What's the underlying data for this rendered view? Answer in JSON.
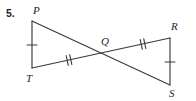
{
  "figure": {
    "problem_number": "5.",
    "stroke_color": "#3a3a3a",
    "label_color": "#1f1f1f",
    "background_color": "#ffffff",
    "vertices": [
      {
        "id": "P",
        "label": "P",
        "x": 32,
        "y": 21,
        "label_x": 33,
        "label_y": 5
      },
      {
        "id": "T",
        "label": "T",
        "x": 32,
        "y": 68,
        "label_x": 26,
        "label_y": 73
      },
      {
        "id": "Q",
        "label": "Q",
        "x": 106,
        "y": 53,
        "label_x": 101,
        "label_y": 36
      },
      {
        "id": "R",
        "label": "R",
        "x": 170,
        "y": 38,
        "label_x": 171,
        "label_y": 21
      },
      {
        "id": "S",
        "label": "S",
        "x": 170,
        "y": 85,
        "label_x": 169,
        "label_y": 88
      }
    ],
    "segments": [
      {
        "name": "PT",
        "from": "P",
        "to": "T",
        "x1": 32,
        "y1": 21,
        "x2": 32,
        "y2": 68,
        "ticks": 1
      },
      {
        "name": "RS",
        "from": "R",
        "to": "S",
        "x1": 170,
        "y1": 38,
        "x2": 170,
        "y2": 85,
        "ticks": 1
      },
      {
        "name": "PS",
        "from": "P",
        "to": "S",
        "x1": 32,
        "y1": 21,
        "x2": 170,
        "y2": 85,
        "ticks": 0
      },
      {
        "name": "TR",
        "from": "T",
        "to": "R",
        "x1": 32,
        "y1": 68,
        "x2": 170,
        "y2": 38,
        "ticks": 0
      }
    ],
    "tick_groups": [
      {
        "name": "tick-PT",
        "on_segment": "PT",
        "count": 1,
        "cx": 32,
        "cy": 45,
        "angle_deg": 90
      },
      {
        "name": "tick-RS",
        "on_segment": "RS",
        "count": 1,
        "cx": 170,
        "cy": 62,
        "angle_deg": 90
      },
      {
        "name": "tick-TQ",
        "on_segment": "TR",
        "count": 2,
        "cx": 69,
        "cy": 60,
        "angle_deg": 347.7
      },
      {
        "name": "tick-QR",
        "on_segment": "TR",
        "count": 2,
        "cx": 143,
        "cy": 44,
        "angle_deg": 347.7
      }
    ]
  }
}
